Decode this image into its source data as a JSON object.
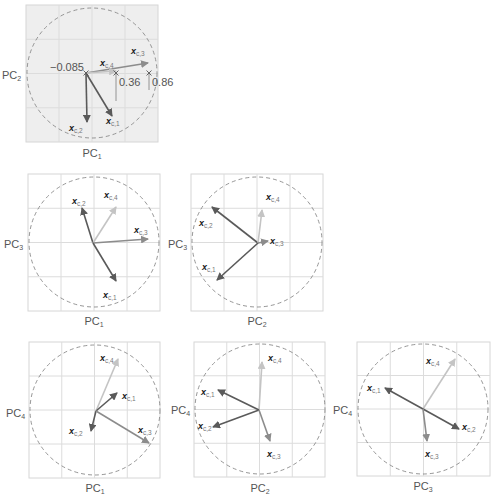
{
  "figure": {
    "colors": {
      "c1": "#5a5a5a",
      "c2": "#5a5a5a",
      "c3": "#8c8c8c",
      "c4": "#c4c4c4",
      "panel1_bg": "#eeeeee",
      "grid": "#dcdcdc",
      "circle": "#8a8a8a"
    },
    "vector_names": [
      "x_c,1",
      "x_c,2",
      "x_c,3",
      "x_c,4"
    ],
    "panels": [
      {
        "id": "pc1-pc2",
        "box": [
          26,
          5,
          132,
          137
        ],
        "bg": "#eeeeee",
        "circle": [
          92,
          73,
          65
        ],
        "origin": [
          86,
          73
        ],
        "xlabel": "PC",
        "xsub": "1",
        "xlabel_pos": [
          92,
          157
        ],
        "ylabel": "PC",
        "ysub": "2",
        "ylabel_pos": [
          2,
          79
        ],
        "vectors": [
          {
            "name": "c1",
            "sub": "c,1",
            "to": [
              112,
              116
            ],
            "label_pos": [
              106,
              124
            ]
          },
          {
            "name": "c2",
            "sub": "c,2",
            "to": [
              87,
              122
            ],
            "label_pos": [
              69,
              131
            ]
          },
          {
            "name": "c3",
            "sub": "c,3",
            "to": [
              148,
              63
            ],
            "label_pos": [
              131,
              54
            ]
          },
          {
            "name": "c4",
            "sub": "c,4",
            "to": [
              116,
              71
            ],
            "label_pos": [
              100,
              66
            ]
          }
        ],
        "markers": [
          [
            86,
            73
          ],
          [
            116,
            73
          ],
          [
            149,
            73
          ]
        ],
        "projections": [
          [
            116,
            73,
            116,
            101
          ],
          [
            149,
            73,
            149,
            90
          ]
        ],
        "numbers": [
          {
            "text": "−0.085",
            "pos": [
              50,
              71
            ]
          },
          {
            "text": "0.36",
            "pos": [
              119,
              86
            ]
          },
          {
            "text": "0.86",
            "pos": [
              152,
              86
            ]
          }
        ]
      },
      {
        "id": "pc1-pc3",
        "box": [
          28,
          174,
          132,
          137
        ],
        "circle": [
          94,
          242,
          65
        ],
        "origin": [
          93,
          243
        ],
        "xlabel": "PC",
        "xsub": "1",
        "xlabel_pos": [
          94,
          325
        ],
        "ylabel": "PC",
        "ysub": "3",
        "ylabel_pos": [
          4,
          248
        ],
        "vectors": [
          {
            "name": "c2",
            "sub": "c,2",
            "to": [
              82,
              208
            ],
            "label_pos": [
              72,
              204
            ]
          },
          {
            "name": "c4",
            "sub": "c,4",
            "to": [
              116,
              207
            ],
            "label_pos": [
              104,
              198
            ]
          },
          {
            "name": "c3",
            "sub": "c,3",
            "to": [
              148,
              239
            ],
            "label_pos": [
              134,
              233
            ]
          },
          {
            "name": "c1",
            "sub": "c,1",
            "to": [
              116,
              281
            ],
            "label_pos": [
              103,
              298
            ]
          }
        ]
      },
      {
        "id": "pc2-pc3",
        "box": [
          191,
          174,
          132,
          137
        ],
        "circle": [
          257,
          242,
          65
        ],
        "origin": [
          258,
          243
        ],
        "xlabel": "PC",
        "xsub": "2",
        "xlabel_pos": [
          257,
          325
        ],
        "ylabel": "PC",
        "ysub": "3",
        "ylabel_pos": [
          168,
          248
        ],
        "vectors": [
          {
            "name": "c2",
            "sub": "c,2",
            "to": [
              212,
              207
            ],
            "label_pos": [
              199,
              226
            ]
          },
          {
            "name": "c4",
            "sub": "c,4",
            "to": [
              262,
              210
            ],
            "label_pos": [
              266,
              200
            ]
          },
          {
            "name": "c3",
            "sub": "c,3",
            "to": [
              268,
              241
            ],
            "label_pos": [
              270,
              244
            ]
          },
          {
            "name": "c1",
            "sub": "c,1",
            "to": [
              217,
              280
            ],
            "label_pos": [
              202,
              270
            ]
          }
        ]
      },
      {
        "id": "pc1-pc4",
        "box": [
          29,
          342,
          131,
          136
        ],
        "circle": [
          95,
          410,
          65
        ],
        "origin": [
          96,
          411
        ],
        "xlabel": "PC",
        "xsub": "1",
        "xlabel_pos": [
          95,
          492
        ],
        "ylabel": "PC",
        "ysub": "4",
        "ylabel_pos": [
          6,
          417
        ],
        "vectors": [
          {
            "name": "c4",
            "sub": "c,4",
            "to": [
              118,
              359
            ],
            "label_pos": [
              100,
              361
            ]
          },
          {
            "name": "c1",
            "sub": "c,1",
            "to": [
              117,
              393
            ],
            "label_pos": [
              122,
              399
            ]
          },
          {
            "name": "c2",
            "sub": "c,2",
            "to": [
              91,
              431
            ],
            "label_pos": [
              69,
              434
            ]
          },
          {
            "name": "c3",
            "sub": "c,3",
            "to": [
              149,
              443
            ],
            "label_pos": [
              138,
              433
            ]
          }
        ]
      },
      {
        "id": "pc2-pc4",
        "box": [
          194,
          342,
          131,
          135
        ],
        "circle": [
          260,
          409,
          65
        ],
        "origin": [
          259,
          410
        ],
        "xlabel": "PC",
        "xsub": "2",
        "xlabel_pos": [
          260,
          492
        ],
        "ylabel": "PC",
        "ysub": "4",
        "ylabel_pos": [
          171,
          414
        ],
        "vectors": [
          {
            "name": "c4",
            "sub": "c,4",
            "to": [
              262,
              362
            ],
            "label_pos": [
              268,
              361
            ]
          },
          {
            "name": "c1",
            "sub": "c,1",
            "to": [
              218,
              390
            ],
            "label_pos": [
              201,
              395
            ]
          },
          {
            "name": "c2",
            "sub": "c,2",
            "to": [
              213,
              427
            ],
            "label_pos": [
              198,
              429
            ]
          },
          {
            "name": "c3",
            "sub": "c,3",
            "to": [
              270,
              441
            ],
            "label_pos": [
              267,
              457
            ]
          }
        ]
      },
      {
        "id": "pc3-pc4",
        "box": [
          357,
          342,
          133,
          134
        ],
        "circle": [
          423,
          409,
          65
        ],
        "origin": [
          423,
          409
        ],
        "xlabel": "PC",
        "xsub": "3",
        "xlabel_pos": [
          423,
          490
        ],
        "ylabel": "PC",
        "ysub": "4",
        "ylabel_pos": [
          333,
          414
        ],
        "vectors": [
          {
            "name": "c4",
            "sub": "c,4",
            "to": [
              455,
              359
            ],
            "label_pos": [
              426,
              364
            ]
          },
          {
            "name": "c1",
            "sub": "c,1",
            "to": [
              385,
              388
            ],
            "label_pos": [
              367,
              391
            ]
          },
          {
            "name": "c2",
            "sub": "c,2",
            "to": [
              459,
              429
            ],
            "label_pos": [
              462,
              430
            ]
          },
          {
            "name": "c3",
            "sub": "c,3",
            "to": [
              427,
              441
            ],
            "label_pos": [
              425,
              457
            ]
          }
        ]
      }
    ]
  }
}
